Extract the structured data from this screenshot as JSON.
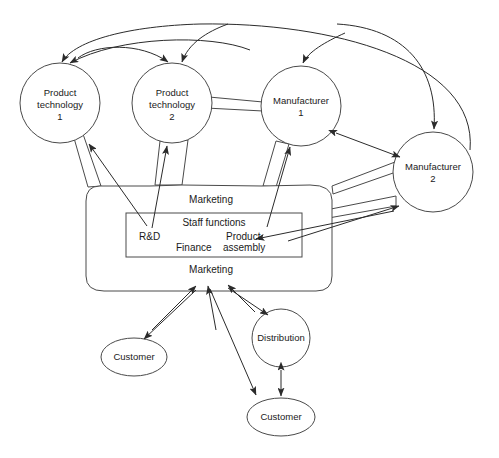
{
  "diagram": {
    "stroke_color": "#4a4a4a",
    "line_color": "#2b2b2b",
    "text_color": "#1a1a1a",
    "background": "#ffffff"
  },
  "nodes": {
    "product_technology_1": {
      "line1": "Product",
      "line2": "technology",
      "line3": "1"
    },
    "product_technology_2": {
      "line1": "Product",
      "line2": "technology",
      "line3": "2"
    },
    "manufacturer_1": {
      "line1": "Manufacturer",
      "line2": "1"
    },
    "manufacturer_2": {
      "line1": "Manufacturer",
      "line2": "2"
    },
    "customer_left": {
      "label": "Customer"
    },
    "customer_bottom": {
      "label": "Customer"
    },
    "distribution": {
      "label": "Distribution"
    }
  },
  "firm": {
    "marketing_top": "Marketing",
    "marketing_bottom": "Marketing",
    "staff_functions": "Staff functions",
    "rnd": "R&D",
    "finance": "Finance",
    "product_line1": "Product",
    "product_line2": "assembly"
  }
}
